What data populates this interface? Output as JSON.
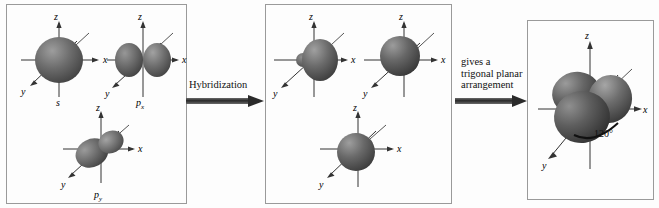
{
  "figure": {
    "colors": {
      "orbital_dark": "#4a4a4a",
      "orbital_mid": "#6e6e6e",
      "orbital_light": "#a8a8a8",
      "axis": "#222222",
      "panel_border": "#9a9a9a",
      "background": "#fdfdfd",
      "text": "#111111"
    }
  },
  "panels": {
    "atomic": {
      "name": "atomic-orbitals-panel",
      "orbitals": [
        {
          "label": "s",
          "label_sub": "",
          "kind": "sphere",
          "axes": [
            "z",
            "x",
            "y"
          ]
        },
        {
          "label": "p",
          "label_sub": "x",
          "kind": "dumbbell-x",
          "axes": [
            "z",
            "x",
            "y"
          ]
        },
        {
          "label": "p",
          "label_sub": "y",
          "kind": "dumbbell-y",
          "axes": [
            "z",
            "x",
            "y"
          ]
        }
      ]
    },
    "hybrid": {
      "name": "hybrid-orbitals-panel",
      "orbitals": [
        {
          "label": "",
          "label_sub": "",
          "kind": "hybrid-right",
          "axes": [
            "z",
            "x",
            "y"
          ]
        },
        {
          "label": "",
          "label_sub": "",
          "kind": "hybrid-upperleft",
          "axes": [
            "z",
            "x",
            "y"
          ]
        },
        {
          "label": "",
          "label_sub": "",
          "kind": "hybrid-lowerleft",
          "axes": [
            "z",
            "x",
            "y"
          ]
        }
      ]
    },
    "result": {
      "name": "trigonal-planar-panel",
      "angle_label": "120°",
      "axes": [
        "z",
        "x",
        "y"
      ],
      "lobe_count": 3
    }
  },
  "arrows": [
    {
      "name": "hybridization-arrow",
      "label": "Hybridization",
      "direction": "right"
    },
    {
      "name": "arrangement-arrow",
      "label": "gives a\ntrigonal planar\narrangement",
      "direction": "right"
    }
  ],
  "axis_labels": {
    "x": "x",
    "y": "y",
    "z": "z"
  }
}
